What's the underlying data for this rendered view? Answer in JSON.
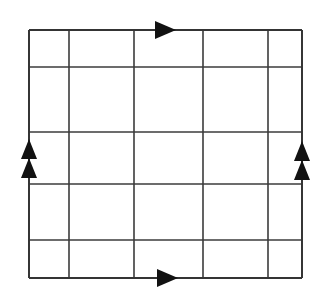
{
  "figure": {
    "kind": "topology-identification-square",
    "background_color": "#ffffff",
    "line_color": "#3b3b3b",
    "boundary_color": "#343434",
    "arrow_color": "#121212",
    "line_width": 1.6,
    "boundary_width": 1.9
  },
  "grid": {
    "columns": 5,
    "rows": 5,
    "vertical_line_x": [
      29,
      69,
      134,
      203,
      268,
      302
    ],
    "horizontal_line_y": [
      30,
      67,
      132,
      184,
      240,
      278
    ],
    "left": 29,
    "right": 302,
    "top": 30,
    "bottom": 278,
    "width": 273,
    "height": 248
  },
  "edges": [
    {
      "name": "top-edge",
      "orientation": "horizontal",
      "direction": "right",
      "arrow_count": 1,
      "label": "a",
      "x1": 29,
      "y1": 30,
      "x2": 302,
      "y2": 30
    },
    {
      "name": "bottom-edge",
      "orientation": "horizontal",
      "direction": "right",
      "arrow_count": 1,
      "label": "a",
      "x1": 29,
      "y1": 278,
      "x2": 302,
      "y2": 278
    },
    {
      "name": "left-edge",
      "orientation": "vertical",
      "direction": "up",
      "arrow_count": 2,
      "label": "b",
      "x1": 29,
      "y1": 30,
      "x2": 29,
      "y2": 278
    },
    {
      "name": "right-edge",
      "orientation": "vertical",
      "direction": "up",
      "arrow_count": 2,
      "label": "b",
      "x1": 302,
      "y1": 30,
      "x2": 302,
      "y2": 278
    }
  ],
  "arrows": [
    {
      "name": "top-edge-arrow",
      "direction": "right",
      "tip_x": 176,
      "tip_y": 30,
      "length": 21,
      "half_width": 9
    },
    {
      "name": "bottom-edge-arrow",
      "direction": "right",
      "tip_x": 178,
      "tip_y": 278,
      "length": 21,
      "half_width": 9
    },
    {
      "name": "left-edge-arrow-upper",
      "direction": "up",
      "tip_x": 29,
      "tip_y": 139,
      "length": 20,
      "half_width": 8
    },
    {
      "name": "left-edge-arrow-lower",
      "direction": "up",
      "tip_x": 29,
      "tip_y": 158,
      "length": 20,
      "half_width": 8
    },
    {
      "name": "right-edge-arrow-upper",
      "direction": "up",
      "tip_x": 302,
      "tip_y": 141,
      "length": 20,
      "half_width": 8
    },
    {
      "name": "right-edge-arrow-lower",
      "direction": "up",
      "tip_x": 302,
      "tip_y": 160,
      "length": 20,
      "half_width": 8
    }
  ],
  "chart_data": {
    "type": "diagram",
    "title": "",
    "subtitle": "",
    "xlabel": "",
    "ylabel": "",
    "grid": true,
    "legend": null,
    "annotations": []
  }
}
